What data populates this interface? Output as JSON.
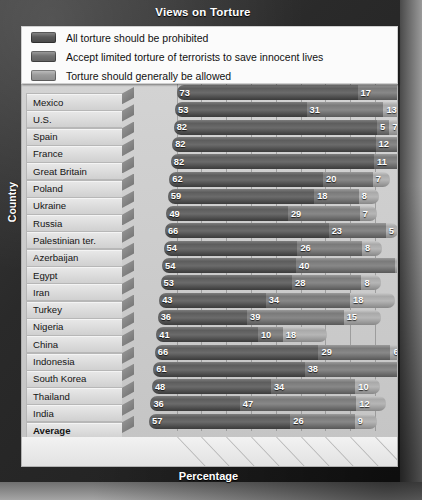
{
  "title": "Views on Torture",
  "axis_caption_y": "Country",
  "axis_caption_x": "Percentage",
  "legend": [
    {
      "label": "All torture should be prohibited",
      "color": "#5a5a5a"
    },
    {
      "label": "Accept limited torture of terrorists to save innocent lives",
      "color": "#727272"
    },
    {
      "label": "Torture should generally be allowed",
      "color": "#9b9b9b"
    }
  ],
  "chart_data": {
    "type": "bar",
    "orientation": "horizontal",
    "stacked": true,
    "title": "Views on Torture",
    "xlabel": "Percentage",
    "ylabel": "Country",
    "xlim": [
      0,
      100
    ],
    "xticks": [
      "0%",
      "10%",
      "20%",
      "30%",
      "40%",
      "50%",
      "60%",
      "70%",
      "80%",
      "90%",
      "100%"
    ],
    "grid": true,
    "legend_position": "top",
    "categories": [
      "Mexico",
      "U.S.",
      "Spain",
      "France",
      "Great Britain",
      "Poland",
      "Ukraine",
      "Russia",
      "Palestinian ter.",
      "Azerbaijan",
      "Egypt",
      "Iran",
      "Turkey",
      "Nigeria",
      "China",
      "Indonesia",
      "South Korea",
      "Thailand",
      "India",
      "Average"
    ],
    "series": [
      {
        "name": "All torture should be prohibited",
        "values": [
          73,
          53,
          82,
          82,
          82,
          62,
          59,
          49,
          66,
          54,
          54,
          53,
          43,
          36,
          41,
          66,
          61,
          48,
          36,
          57
        ]
      },
      {
        "name": "Accept limited torture of terrorists to save innocent lives",
        "values": [
          17,
          31,
          5,
          12,
          11,
          20,
          18,
          29,
          23,
          26,
          40,
          28,
          34,
          39,
          10,
          29,
          38,
          34,
          47,
          26
        ]
      },
      {
        "name": "Torture should generally be allowed",
        "values": [
          7,
          13,
          7,
          4,
          4,
          7,
          8,
          7,
          5,
          8,
          6,
          8,
          18,
          15,
          18,
          6,
          13,
          10,
          12,
          9
        ]
      }
    ]
  }
}
